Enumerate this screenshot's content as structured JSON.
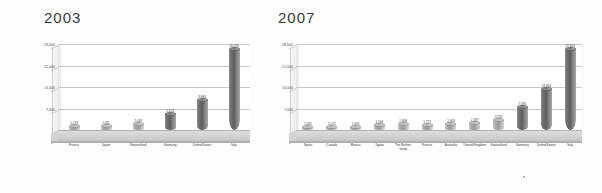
{
  "chart_data": [
    {
      "type": "bar",
      "title": "2003",
      "xlabel": "",
      "ylabel": "",
      "ylim": [
        0,
        28000
      ],
      "yticks": [
        "7,000",
        "14,000",
        "21,000",
        "28,000"
      ],
      "ytick_values": [
        7000,
        14000,
        21000,
        28000
      ],
      "grid": true,
      "legend": "none",
      "categories": [
        "France",
        "Japan",
        "Switzerland",
        "Germany",
        "United States",
        "Italy"
      ],
      "values": [
        1176,
        1411,
        2049,
        5125,
        9884,
        26294
      ],
      "labels": [
        "1,176",
        "1,411",
        "2,049",
        "5,125",
        "9,884",
        "26,294"
      ]
    },
    {
      "type": "bar",
      "title": "2007",
      "xlabel": "",
      "ylabel": "",
      "ylim": [
        0,
        28000
      ],
      "yticks": [
        "7,000",
        "14,000",
        "21,000",
        "28,000"
      ],
      "ytick_values": [
        7000,
        14000,
        21000,
        28000
      ],
      "grid": true,
      "legend": "none",
      "categories": [
        "Spain",
        "Canada",
        "Mexico",
        "Japan",
        "The Nether-lands",
        "France",
        "Australia",
        "United Kingdom",
        "Switzerland",
        "Germany",
        "United States",
        "Italy"
      ],
      "values": [
        1081,
        1072,
        1095,
        1546,
        1808,
        1771,
        2063,
        2187,
        3292,
        7481,
        13364,
        27443
      ],
      "labels": [
        "1,081",
        "1,072",
        "1,095",
        "1,546",
        "1,808",
        "1,771",
        "2,063",
        "2,187",
        "3,292",
        "7,481",
        "13,364",
        "27,443"
      ]
    }
  ]
}
